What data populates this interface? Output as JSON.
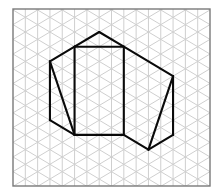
{
  "figure": {
    "grid": {
      "type": "isometric",
      "columns": 16,
      "colors": {
        "grid_line": "#cfcfcf",
        "frame": "#7a7a7a",
        "edge": "#0a0a0a",
        "background": "#ffffff"
      }
    },
    "shape": {
      "description": "Net-like figure: central rectangle with triangular roof, left and right quadrilaterals each split by a diagonal",
      "vertices": {
        "apex": {
          "col": 7,
          "row": 3
        },
        "rect_tl": {
          "col": 5,
          "row": 5
        },
        "rect_tr": {
          "col": 9,
          "row": 5
        },
        "rect_bl": {
          "col": 5,
          "row": 17
        },
        "rect_br": {
          "col": 9,
          "row": 17
        },
        "left_top": {
          "col": 3,
          "row": 7
        },
        "left_bottom": {
          "col": 3,
          "row": 15
        },
        "right_top": {
          "col": 13,
          "row": 9
        },
        "right_bottom": {
          "col": 13,
          "row": 17
        },
        "bottom": {
          "col": 11,
          "row": 19
        }
      },
      "edges": [
        {
          "name": "roof-left",
          "from": "apex",
          "to": "rect_tl"
        },
        {
          "name": "roof-right",
          "from": "apex",
          "to": "rect_tr"
        },
        {
          "name": "left-upper-slope",
          "from": "rect_tl",
          "to": "left_top"
        },
        {
          "name": "right-upper-slope",
          "from": "rect_tr",
          "to": "right_top"
        },
        {
          "name": "rect-top",
          "from": "rect_tl",
          "to": "rect_tr"
        },
        {
          "name": "rect-left",
          "from": "rect_tl",
          "to": "rect_bl"
        },
        {
          "name": "rect-right",
          "from": "rect_tr",
          "to": "rect_br"
        },
        {
          "name": "rect-bottom",
          "from": "rect_bl",
          "to": "rect_br"
        },
        {
          "name": "left-outer-vertical",
          "from": "left_top",
          "to": "left_bottom"
        },
        {
          "name": "left-lower-slope",
          "from": "left_bottom",
          "to": "rect_bl"
        },
        {
          "name": "left-diagonal",
          "from": "left_top",
          "to": "rect_bl"
        },
        {
          "name": "right-outer-vertical",
          "from": "right_top",
          "to": "right_bottom"
        },
        {
          "name": "right-lower-slope",
          "from": "right_bottom",
          "to": "bottom"
        },
        {
          "name": "bottom-slope",
          "from": "rect_br",
          "to": "bottom"
        },
        {
          "name": "right-diagonal",
          "from": "right_top",
          "to": "bottom"
        }
      ]
    }
  }
}
